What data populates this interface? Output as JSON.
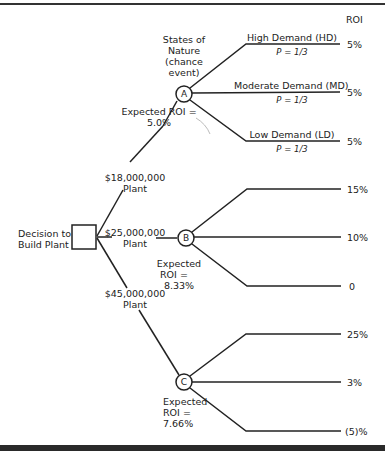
{
  "diagram": {
    "type": "decision-tree",
    "roi_header": "ROI",
    "decision_node": {
      "label_line1": "Decision to",
      "label_line2": "Build Plant"
    },
    "states_of_nature": {
      "line1": "States of",
      "line2": "Nature",
      "line3": "(chance",
      "line4": "event)"
    },
    "alternatives": [
      {
        "node": "A",
        "plant_cost": "$18,000,000",
        "plant_label": "Plant",
        "expected_line1": "Expected ROI =",
        "expected_value": "5.0%",
        "outcomes": [
          {
            "state": "High Demand (HD)",
            "probability": "P = 1/3",
            "roi": "5%"
          },
          {
            "state": "Moderate Demand (MD)",
            "probability": "P = 1/3",
            "roi": "5%"
          },
          {
            "state": "Low Demand (LD)",
            "probability": "P = 1/3",
            "roi": "5%"
          }
        ]
      },
      {
        "node": "B",
        "plant_cost": "$25,000,000",
        "plant_label": "Plant",
        "expected_line1": "Expected",
        "expected_line2": "ROI =",
        "expected_value": "8.33%",
        "outcomes": [
          {
            "roi": "15%"
          },
          {
            "roi": "10%"
          },
          {
            "roi": "0"
          }
        ]
      },
      {
        "node": "C",
        "plant_cost": "$45,000,000",
        "plant_label": "Plant",
        "expected_line1": "Expected",
        "expected_line2": "ROI =",
        "expected_value": "7.66%",
        "outcomes": [
          {
            "roi": "25%"
          },
          {
            "roi": "3%"
          },
          {
            "roi": "(5)%"
          }
        ]
      }
    ]
  }
}
